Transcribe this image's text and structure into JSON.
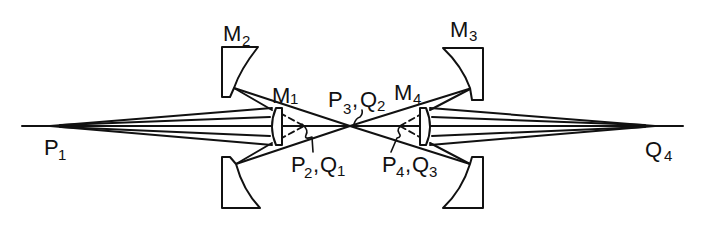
{
  "diagram": {
    "type": "optical-ray-diagram",
    "colors": {
      "ink": "#111111",
      "background": "#ffffff"
    },
    "labels": {
      "m2": {
        "base": "M",
        "sub": "2"
      },
      "m1": {
        "base": "M",
        "sub": "1"
      },
      "m3": {
        "base": "M",
        "sub": "3"
      },
      "m4": {
        "base": "M",
        "sub": "4"
      },
      "p1": {
        "base": "P",
        "sub": "1"
      },
      "p3q2": {
        "base1": "P",
        "sub1": "3",
        "sep": ",",
        "base2": "Q",
        "sub2": "2"
      },
      "p2q1": {
        "base1": "P",
        "sub1": "2",
        "sep": ",",
        "base2": "Q",
        "sub2": "1"
      },
      "p4q3": {
        "base1": "P",
        "sub1": "4",
        "sep": ",",
        "base2": "Q",
        "sub2": "3"
      },
      "q4": {
        "base": "Q",
        "sub": "4"
      }
    },
    "components": [
      {
        "id": "M1",
        "kind": "convex-mirror-small"
      },
      {
        "id": "M2",
        "kind": "concave-mirror-large"
      },
      {
        "id": "M3",
        "kind": "concave-mirror-large"
      },
      {
        "id": "M4",
        "kind": "convex-mirror-small"
      }
    ],
    "points": [
      "P1",
      "P2",
      "Q1",
      "P3",
      "Q2",
      "P4",
      "Q3",
      "Q4"
    ]
  }
}
